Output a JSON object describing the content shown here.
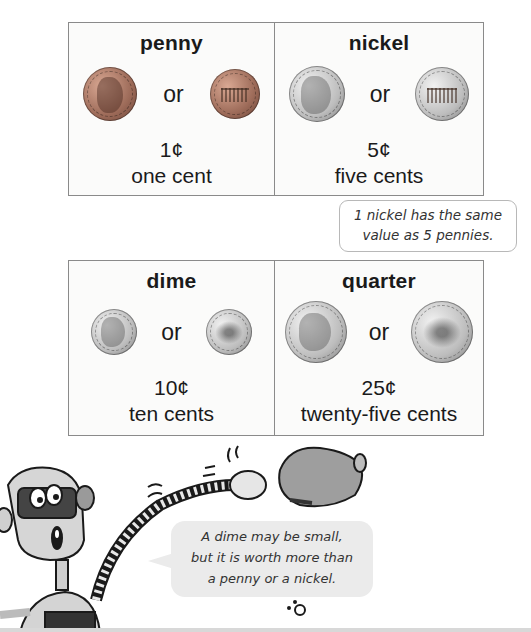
{
  "coins": [
    {
      "name": "penny",
      "or_label": "or",
      "value": "1¢",
      "words": "one cent",
      "metal": "copper",
      "obverse": "lincoln-portrait",
      "reverse": "lincoln-memorial"
    },
    {
      "name": "nickel",
      "or_label": "or",
      "value": "5¢",
      "words": "five cents",
      "metal": "silver",
      "obverse": "jefferson-portrait",
      "reverse": "monticello"
    },
    {
      "name": "dime",
      "or_label": "or",
      "value": "10¢",
      "words": "ten cents",
      "metal": "silver",
      "obverse": "roosevelt-portrait",
      "reverse": "torch-branches"
    },
    {
      "name": "quarter",
      "or_label": "or",
      "value": "25¢",
      "words": "twenty-five cents",
      "metal": "silver",
      "obverse": "washington-portrait",
      "reverse": "eagle"
    }
  ],
  "note": {
    "line1": "1 nickel has the same",
    "line2": "value as 5 pennies."
  },
  "robot_speech": {
    "line1": "A dime may be small,",
    "line2": "but it is worth more than",
    "line3": "a penny or a nickel."
  },
  "colors": {
    "border": "#8a8a8a",
    "bubble_bg": "#ebebeb",
    "copper": "#9c6a58",
    "silver": "#bdbdbd"
  }
}
